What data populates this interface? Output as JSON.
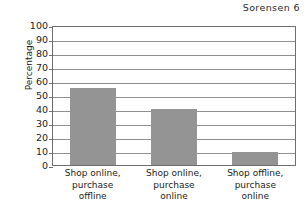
{
  "header": {
    "running_head": "Sorensen 6"
  },
  "chart_data": {
    "type": "bar",
    "title": "",
    "xlabel": "",
    "ylabel": "Percentage",
    "ylim": [
      0,
      100
    ],
    "ytick_step": 10,
    "yticks": [
      100,
      90,
      80,
      70,
      60,
      50,
      40,
      30,
      20,
      10,
      0
    ],
    "grid": true,
    "legend": false,
    "bar_color": "#949494",
    "axis_color": "#6e6e6e",
    "gridline_color": "#8f8f8f",
    "categories": [
      "Shop online, purchase offline",
      "Shop online, purchase online",
      "Shop offline, purchase online"
    ],
    "category_lines": [
      [
        "Shop online,",
        "purchase",
        "offline"
      ],
      [
        "Shop online,",
        "purchase",
        "online"
      ],
      [
        "Shop offline,",
        "purchase",
        "online"
      ]
    ],
    "values": [
      55,
      40,
      9
    ]
  }
}
